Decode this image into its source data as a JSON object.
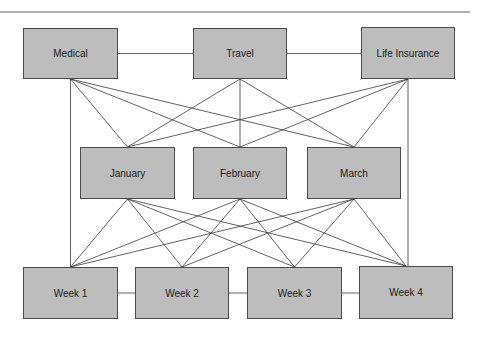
{
  "diagram": {
    "type": "layered network",
    "colors": {
      "node_fill": "#bdbdbd",
      "node_border": "#4a4a4a",
      "edge": "#3a3a3a",
      "rule": "#333333",
      "background": "#ffffff"
    },
    "nodes": [
      {
        "id": "medical",
        "label": "Medical",
        "layer": 0,
        "x": 23,
        "y": 28,
        "w": 95,
        "h": 51
      },
      {
        "id": "travel",
        "label": "Travel",
        "layer": 0,
        "x": 193,
        "y": 28,
        "w": 94,
        "h": 51
      },
      {
        "id": "life",
        "label": "Life Insurance",
        "layer": 0,
        "x": 361,
        "y": 27,
        "w": 94,
        "h": 52
      },
      {
        "id": "january",
        "label": "January",
        "layer": 1,
        "x": 80,
        "y": 147,
        "w": 95,
        "h": 52
      },
      {
        "id": "february",
        "label": "February",
        "layer": 1,
        "x": 193,
        "y": 147,
        "w": 94,
        "h": 52
      },
      {
        "id": "march",
        "label": "March",
        "layer": 1,
        "x": 307,
        "y": 147,
        "w": 94,
        "h": 52
      },
      {
        "id": "week1",
        "label": "Week 1",
        "layer": 2,
        "x": 23,
        "y": 267,
        "w": 95,
        "h": 52
      },
      {
        "id": "week2",
        "label": "Week 2",
        "layer": 2,
        "x": 135,
        "y": 267,
        "w": 94,
        "h": 52
      },
      {
        "id": "week3",
        "label": "Week 3",
        "layer": 2,
        "x": 247,
        "y": 267,
        "w": 95,
        "h": 52
      },
      {
        "id": "week4",
        "label": "Week 4",
        "layer": 2,
        "x": 359,
        "y": 266,
        "w": 94,
        "h": 53
      }
    ],
    "edges": [
      {
        "from": "medical",
        "to": "travel",
        "kind": "horizontal"
      },
      {
        "from": "travel",
        "to": "life",
        "kind": "horizontal"
      },
      {
        "from": "week1",
        "to": "week2",
        "kind": "horizontal"
      },
      {
        "from": "week2",
        "to": "week3",
        "kind": "horizontal"
      },
      {
        "from": "week3",
        "to": "week4",
        "kind": "horizontal"
      },
      {
        "from": "medical",
        "to": "week1",
        "kind": "vertical"
      },
      {
        "from": "life",
        "to": "week4",
        "kind": "vertical"
      },
      {
        "from": "medical",
        "to": "january"
      },
      {
        "from": "medical",
        "to": "february"
      },
      {
        "from": "medical",
        "to": "march"
      },
      {
        "from": "travel",
        "to": "january"
      },
      {
        "from": "travel",
        "to": "february"
      },
      {
        "from": "travel",
        "to": "march"
      },
      {
        "from": "life",
        "to": "january"
      },
      {
        "from": "life",
        "to": "february"
      },
      {
        "from": "life",
        "to": "march"
      },
      {
        "from": "january",
        "to": "week1"
      },
      {
        "from": "january",
        "to": "week2"
      },
      {
        "from": "january",
        "to": "week3"
      },
      {
        "from": "january",
        "to": "week4"
      },
      {
        "from": "february",
        "to": "week1"
      },
      {
        "from": "february",
        "to": "week2"
      },
      {
        "from": "february",
        "to": "week3"
      },
      {
        "from": "february",
        "to": "week4"
      },
      {
        "from": "march",
        "to": "week1"
      },
      {
        "from": "march",
        "to": "week2"
      },
      {
        "from": "march",
        "to": "week3"
      },
      {
        "from": "march",
        "to": "week4"
      }
    ],
    "top_rule": {
      "x1": 0,
      "x2": 470,
      "y": 12
    }
  }
}
